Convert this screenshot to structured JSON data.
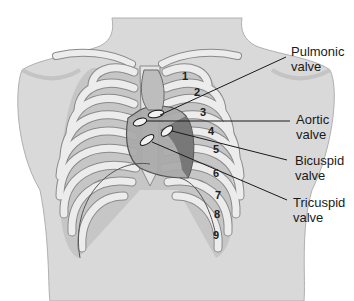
{
  "diagram": {
    "colors": {
      "skin": "#d9d9d9",
      "skin_shadow": "#bdbdbd",
      "rib": "#ececec",
      "rib_outline": "#8a8a8a",
      "interspace": "#c4c4c4",
      "heart": "#a9a9a9",
      "heart_dark": "#6e6e6e",
      "line": "#1a1a1a",
      "text": "#1a1a1a"
    },
    "labels": [
      {
        "id": "pulmonic",
        "line1": "Pulmonic",
        "line2": "valve"
      },
      {
        "id": "aortic",
        "line1": "Aortic",
        "line2": "valve"
      },
      {
        "id": "bicuspid",
        "line1": "Bicuspid",
        "line2": "valve"
      },
      {
        "id": "tricuspid",
        "line1": "Tricuspid",
        "line2": "valve"
      }
    ],
    "interspace_numbers": [
      "1",
      "2",
      "3",
      "4",
      "5",
      "6",
      "7",
      "8",
      "9"
    ]
  }
}
